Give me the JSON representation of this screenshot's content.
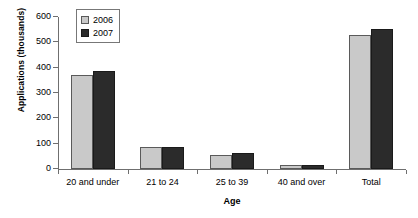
{
  "chart_data": {
    "type": "bar",
    "title": "",
    "xlabel": "Age",
    "ylabel": "Applications (thousands)",
    "categories": [
      "20 and under",
      "21 to 24",
      "25 to 39",
      "40 and over",
      "Total"
    ],
    "series": [
      {
        "name": "2006",
        "color": "#c9c9c9",
        "values": [
          372,
          87,
          57,
          17,
          530
        ]
      },
      {
        "name": "2007",
        "color": "#2b2b2b",
        "values": [
          388,
          88,
          62,
          15,
          552
        ]
      }
    ],
    "ylim": [
      0,
      600
    ],
    "yticks": [
      0,
      100,
      200,
      300,
      400,
      500,
      600
    ],
    "ytick_labels": [
      "0",
      "100",
      "200",
      "300",
      "400",
      "500",
      "600"
    ],
    "grid": false,
    "legend_position": "top-left-inside"
  },
  "legend": {
    "items": [
      {
        "label": "2006"
      },
      {
        "label": "2007"
      }
    ]
  }
}
